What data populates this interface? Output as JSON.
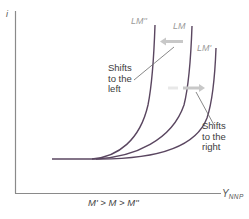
{
  "diagram": {
    "type": "economics-lm-curve-shift",
    "axes": {
      "y_label": "i",
      "x_label_main": "Y",
      "x_label_sub": "NNP"
    },
    "curves": [
      {
        "id": "lm_double_prime",
        "label": "LM''"
      },
      {
        "id": "lm",
        "label": "LM"
      },
      {
        "id": "lm_prime",
        "label": "LM'"
      }
    ],
    "annotations": {
      "shift_left": "Shifts\nto the\nleft",
      "shift_right": "Shifts\nto the\nright"
    },
    "caption": "M' > M > M''",
    "colors": {
      "curve": "#5a4660",
      "axis": "#7a7a7a",
      "arrow": "#c8c8c8",
      "leader": "#6a6a6a"
    }
  }
}
